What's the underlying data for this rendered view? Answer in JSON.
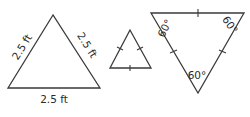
{
  "diagram": {
    "title": "",
    "triangles": [
      {
        "id": "triangle-with-side-lengths",
        "side_labels": {
          "left": "2.5 ft",
          "right": "2.5 ft",
          "bottom": "2.5 ft"
        }
      },
      {
        "id": "triangle-with-congruence-marks",
        "tick_marks": 3
      },
      {
        "id": "triangle-with-angle-marks",
        "angle_labels": {
          "top_left": "60°",
          "top_right": "60°",
          "bottom": "60°"
        },
        "tick_marks": 3
      }
    ],
    "colors": {
      "stroke": "#3a3a3a",
      "text": "#2a2a2a",
      "background": "#ffffff"
    }
  }
}
